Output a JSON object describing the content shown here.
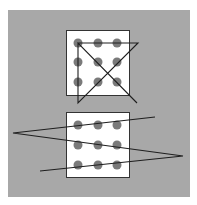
{
  "figure": {
    "width": 197,
    "height": 205,
    "background": "#ffffff",
    "panel": {
      "x": 8,
      "y": 10,
      "w": 182,
      "h": 187,
      "color": "#a8a8a8"
    },
    "colors": {
      "box_fill": "#ffffff",
      "box_stroke": "#333333",
      "dot": "#7a7a7a",
      "line": "#1e1e1e"
    }
  },
  "puzzles": [
    {
      "name": "four-line-solution",
      "box": {
        "x": 66,
        "y": 30,
        "w": 63,
        "h": 65
      },
      "dots": [
        [
          78,
          43
        ],
        [
          98,
          43
        ],
        [
          117,
          43
        ],
        [
          78,
          62
        ],
        [
          98,
          62
        ],
        [
          117,
          62
        ],
        [
          78,
          82
        ],
        [
          98,
          82
        ],
        [
          117,
          82
        ]
      ],
      "path": [
        [
          78,
          43
        ],
        [
          138,
          43
        ],
        [
          78,
          103
        ],
        [
          78,
          43
        ],
        [
          137,
          103
        ]
      ]
    },
    {
      "name": "three-line-solution",
      "box": {
        "x": 66,
        "y": 112,
        "w": 63,
        "h": 65
      },
      "dots": [
        [
          78,
          125
        ],
        [
          98,
          125
        ],
        [
          117,
          125
        ],
        [
          78,
          145
        ],
        [
          98,
          145
        ],
        [
          117,
          145
        ],
        [
          78,
          165
        ],
        [
          98,
          165
        ],
        [
          117,
          165
        ]
      ],
      "path": [
        [
          155,
          117
        ],
        [
          13,
          133
        ],
        [
          183,
          156
        ],
        [
          40,
          171
        ]
      ]
    }
  ]
}
